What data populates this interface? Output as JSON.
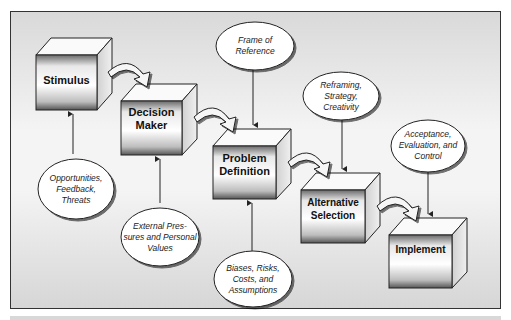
{
  "diagram": {
    "type": "process-flow",
    "boxes": [
      {
        "id": "stimulus",
        "label_line1": "Stimulus",
        "label_line2": ""
      },
      {
        "id": "decision-maker",
        "label_line1": "Decision",
        "label_line2": "Maker"
      },
      {
        "id": "problem-definition",
        "label_line1": "Problem",
        "label_line2": "Definition"
      },
      {
        "id": "alternative-selection",
        "label_line1": "Alternative",
        "label_line2": "Selection"
      },
      {
        "id": "implement",
        "label_line1": "Implement",
        "label_line2": ""
      }
    ],
    "influences": [
      {
        "target": "stimulus",
        "line1": "Opportunities,",
        "line2": "Feedback,",
        "line3": "Threats"
      },
      {
        "target": "decision-maker",
        "line1": "External Pres-",
        "line2": "sures and Personal",
        "line3": "Values"
      },
      {
        "target": "problem-definition",
        "line1": "Frame of",
        "line2": "Reference",
        "line3": ""
      },
      {
        "target": "problem-definition",
        "line1": "Biases, Risks,",
        "line2": "Costs, and",
        "line3": "Assumptions"
      },
      {
        "target": "alternative-selection",
        "line1": "Reframing,",
        "line2": "Strategy,",
        "line3": "Creativity"
      },
      {
        "target": "implement",
        "line1": "Acceptance,",
        "line2": "Evaluation, and",
        "line3": "Control"
      }
    ],
    "flow": [
      "stimulus",
      "decision-maker",
      "problem-definition",
      "alternative-selection",
      "implement"
    ]
  }
}
